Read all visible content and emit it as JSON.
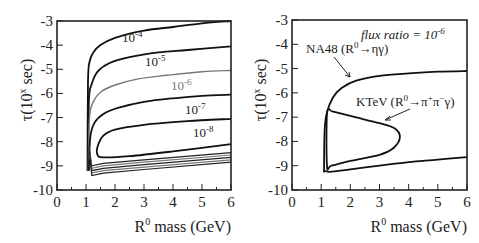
{
  "chart_data": [
    {
      "type": "line",
      "title": "",
      "xlabel": "R0 mass (GeV)",
      "ylabel": "τ(10^x sec)",
      "xlim": [
        0,
        6
      ],
      "ylim": [
        -10,
        -3
      ],
      "xticks": [
        0,
        1,
        2,
        3,
        4,
        5,
        6
      ],
      "yticks": [
        -3,
        -4,
        -5,
        -6,
        -7,
        -8,
        -9,
        -10
      ],
      "grid": false,
      "legend": "inline contour labels",
      "series": [
        {
          "name": "10^-4",
          "color": "#111111",
          "x": [
            1.05,
            1.07,
            1.12,
            1.25,
            1.5,
            2.0,
            3.0,
            4.0,
            5.0,
            6.0
          ],
          "y": [
            -9.2,
            -5.5,
            -4.7,
            -4.3,
            -4.0,
            -3.7,
            -3.4,
            -3.25,
            -3.1,
            -3.0
          ]
        },
        {
          "name": "10^-5",
          "color": "#111111",
          "x": [
            1.07,
            1.1,
            1.2,
            1.4,
            1.8,
            2.5,
            3.5,
            4.5,
            6.0
          ],
          "y": [
            -9.2,
            -6.3,
            -5.6,
            -5.1,
            -4.75,
            -4.5,
            -4.3,
            -4.2,
            -4.05
          ]
        },
        {
          "name": "10^-6",
          "color": "#777777",
          "x": [
            1.08,
            1.12,
            1.25,
            1.5,
            2.0,
            2.8,
            3.8,
            5.0,
            6.0
          ],
          "y": [
            -9.2,
            -7.0,
            -6.35,
            -5.95,
            -5.65,
            -5.4,
            -5.25,
            -5.1,
            -5.05
          ]
        },
        {
          "name": "10^-7",
          "color": "#111111",
          "x": [
            1.1,
            1.15,
            1.3,
            1.6,
            2.1,
            3.0,
            4.0,
            5.0,
            6.0
          ],
          "y": [
            -9.2,
            -7.8,
            -7.2,
            -6.85,
            -6.6,
            -6.35,
            -6.2,
            -6.1,
            -6.05
          ]
        },
        {
          "name": "10^-8",
          "color": "#111111",
          "x": [
            6.0,
            4.5,
            3.0,
            2.0,
            1.6,
            1.4,
            1.4,
            1.6,
            2.5,
            4.0,
            6.0
          ],
          "y": [
            -7.05,
            -7.15,
            -7.3,
            -7.5,
            -7.75,
            -8.2,
            -8.55,
            -8.65,
            -8.6,
            -8.4,
            -8.1
          ]
        }
      ],
      "annotations": [
        "10^-4",
        "10^-5",
        "10^-6",
        "10^-7",
        "10^-8"
      ]
    },
    {
      "type": "line",
      "title": "",
      "xlabel": "R0 mass (GeV)",
      "ylabel": "τ(10^x sec)",
      "xlim": [
        0,
        6
      ],
      "ylim": [
        -10,
        -3
      ],
      "xticks": [
        0,
        1,
        2,
        3,
        4,
        5,
        6
      ],
      "yticks": [
        -3,
        -4,
        -5,
        -6,
        -7,
        -8,
        -9,
        -10
      ],
      "grid": false,
      "series": [
        {
          "name": "NA48 (R0→ηγ)",
          "color": "#111111",
          "x": [
            6.0,
            5.0,
            4.0,
            3.0,
            2.2,
            1.7,
            1.4,
            1.2,
            1.12,
            1.1,
            1.12,
            1.3,
            2.0,
            3.0,
            4.0,
            5.0,
            6.0
          ],
          "y": [
            -5.1,
            -5.13,
            -5.2,
            -5.3,
            -5.5,
            -5.8,
            -6.2,
            -6.8,
            -7.5,
            -9.1,
            -9.2,
            -9.25,
            -9.15,
            -9.0,
            -8.85,
            -8.75,
            -8.65
          ]
        },
        {
          "name": "KTeV (R0→π+π−γ)",
          "color": "#111111",
          "x": [
            1.35,
            2.0,
            3.0,
            3.5,
            3.7,
            3.5,
            3.0,
            2.0,
            1.35,
            1.2,
            1.2,
            1.35
          ],
          "y": [
            -6.75,
            -6.95,
            -7.25,
            -7.45,
            -7.8,
            -8.25,
            -8.55,
            -8.8,
            -9.0,
            -9.0,
            -6.85,
            -6.75
          ]
        }
      ],
      "annotations": [
        "flux ratio = 10^-6",
        "NA48 (R0→ηγ)",
        "KTeV (R0→π+π−γ)"
      ]
    }
  ],
  "left_panel": {
    "ylabel_main": "τ(10",
    "ylabel_sup": "x",
    "ylabel_end": " sec)",
    "xlabel_main": "R",
    "xlabel_sup": "0",
    "xlabel_end": " mass (GeV)",
    "xtick_labels": [
      "0",
      "1",
      "2",
      "3",
      "4",
      "5",
      "6"
    ],
    "ytick_labels": [
      "-3",
      "-4",
      "-5",
      "-6",
      "-7",
      "-8",
      "-9",
      "-10"
    ],
    "contour_labels": [
      {
        "base": "10",
        "exp": "-4"
      },
      {
        "base": "10",
        "exp": "-5"
      },
      {
        "base": "10",
        "exp": "-6"
      },
      {
        "base": "10",
        "exp": "-7"
      },
      {
        "base": "10",
        "exp": "-8"
      }
    ]
  },
  "right_panel": {
    "ylabel_main": "τ(10",
    "ylabel_sup": "x",
    "ylabel_end": " sec)",
    "xlabel_main": "R",
    "xlabel_sup": "0",
    "xlabel_end": " mass (GeV)",
    "xtick_labels": [
      "0",
      "1",
      "2",
      "3",
      "4",
      "5",
      "6"
    ],
    "ytick_labels": [
      "-3",
      "-4",
      "-5",
      "-6",
      "-7",
      "-8",
      "-9",
      "-10"
    ],
    "flux_text": "flux ratio = 10",
    "flux_exp": "-6",
    "na48_a": "NA48 (R",
    "na48_sup": "0",
    "na48_b": "→ηγ)",
    "ktev_a": "KTeV (R",
    "ktev_sup": "0",
    "ktev_b": "→π",
    "ktev_sup2": "+",
    "ktev_c": "π",
    "ktev_sup3": "−",
    "ktev_d": "γ)"
  }
}
